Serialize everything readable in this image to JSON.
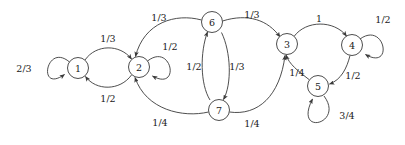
{
  "diagram": {
    "type": "markov-chain-state-transition-diagram",
    "background_color": "#ffffff",
    "stroke_color": "#3a3a3a",
    "text_color": "#1a1a1a",
    "node_radius": 10.5,
    "nodes": [
      {
        "id": "1",
        "label": "1",
        "x": 78,
        "y": 68
      },
      {
        "id": "2",
        "label": "2",
        "x": 139,
        "y": 67
      },
      {
        "id": "3",
        "label": "3",
        "x": 287,
        "y": 44
      },
      {
        "id": "4",
        "label": "4",
        "x": 352,
        "y": 45
      },
      {
        "id": "5",
        "label": "5",
        "x": 318,
        "y": 86
      },
      {
        "id": "6",
        "label": "6",
        "x": 212,
        "y": 22
      },
      {
        "id": "7",
        "label": "7",
        "x": 219,
        "y": 110
      }
    ],
    "edges": [
      {
        "from": "1",
        "to": "1",
        "label": "2/3",
        "label_x": 24,
        "label_y": 68,
        "kind": "self-loop"
      },
      {
        "from": "1",
        "to": "2",
        "label": "1/3",
        "label_x": 108,
        "label_y": 38,
        "kind": "arc"
      },
      {
        "from": "2",
        "to": "1",
        "label": "1/2",
        "label_x": 108,
        "label_y": 98,
        "kind": "arc"
      },
      {
        "from": "2",
        "to": "2",
        "label": "1/2",
        "label_x": 170,
        "label_y": 46,
        "kind": "self-loop"
      },
      {
        "from": "6",
        "to": "2",
        "label": "1/3",
        "label_x": 159,
        "label_y": 17,
        "kind": "arc"
      },
      {
        "from": "7",
        "to": "2",
        "label": "1/4",
        "label_x": 160,
        "label_y": 122,
        "kind": "arc"
      },
      {
        "from": "6",
        "to": "3",
        "label": "1/3",
        "label_x": 252,
        "label_y": 14,
        "kind": "arc"
      },
      {
        "from": "6",
        "to": "7",
        "label": "1/3",
        "label_x": 237,
        "label_y": 66,
        "kind": "arc"
      },
      {
        "from": "7",
        "to": "6",
        "label": "1/2",
        "label_x": 194,
        "label_y": 66,
        "kind": "arc"
      },
      {
        "from": "7",
        "to": "3",
        "label": "1/4",
        "label_x": 252,
        "label_y": 123,
        "kind": "arc"
      },
      {
        "from": "3",
        "to": "4",
        "label": "1",
        "label_x": 319,
        "label_y": 18,
        "kind": "arc"
      },
      {
        "from": "4",
        "to": "4",
        "label": "1/2",
        "label_x": 383,
        "label_y": 19,
        "kind": "self-loop"
      },
      {
        "from": "4",
        "to": "5",
        "label": "1/2",
        "label_x": 353,
        "label_y": 75,
        "kind": "arc"
      },
      {
        "from": "5",
        "to": "3",
        "label": "1/4",
        "label_x": 297,
        "label_y": 72,
        "kind": "arc"
      },
      {
        "from": "5",
        "to": "5",
        "label": "3/4",
        "label_x": 347,
        "label_y": 115,
        "kind": "self-loop"
      }
    ]
  }
}
